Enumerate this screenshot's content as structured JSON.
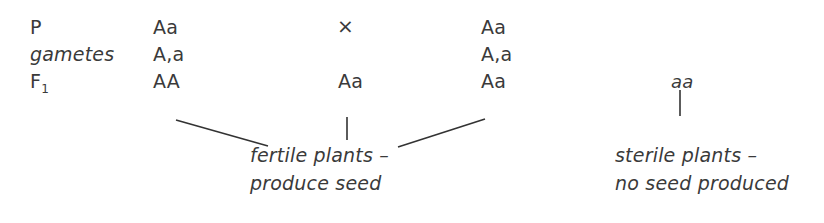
{
  "diagram": {
    "type": "genetic-cross",
    "rows": [
      {
        "label": "P",
        "cells": [
          "Aa",
          "×",
          "Aa"
        ]
      },
      {
        "label": "gametes",
        "cells": [
          "A,a",
          "",
          "A,a"
        ]
      },
      {
        "label": "F",
        "label_subscript": "1",
        "cells": [
          "AA",
          "Aa",
          "Aa",
          "aa"
        ]
      }
    ],
    "annotations": {
      "fertile_line1": "fertile plants –",
      "fertile_line2": "produce seed",
      "sterile_line1": "sterile plants –",
      "sterile_line2": "no seed produced"
    },
    "connectors": [
      {
        "from": "AA",
        "to": "fertile-label"
      },
      {
        "from": "Aa (middle)",
        "to": "fertile-label"
      },
      {
        "from": "Aa (right)",
        "to": "fertile-label"
      },
      {
        "from": "aa",
        "to": "sterile-label"
      }
    ],
    "colors": {
      "text": "#3a3a3a",
      "lines": "#333333",
      "background": "#ffffff"
    }
  }
}
